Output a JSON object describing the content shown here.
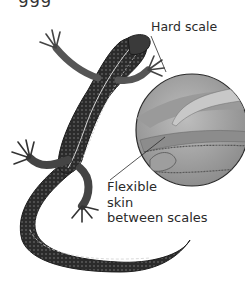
{
  "figure": {
    "top_cropped_text": "ggg",
    "callouts": {
      "hard_scale": {
        "label": "Hard scale"
      },
      "flexible_skin": {
        "lines": [
          "Flexible",
          "skin",
          "between scales"
        ]
      }
    },
    "magnifier": {
      "shape": "circle",
      "content": "overlapping scales cross-section"
    }
  },
  "colors": {
    "background": "#ffffff",
    "lizard_dark": "#2b2b2b",
    "lizard_mid": "#6b6b6b",
    "stripe_light": "#d8d8d8",
    "magnifier_fill": "#a8a8a8",
    "magnifier_light": "#c9c9c9",
    "label_text": "#2a2a2a"
  }
}
